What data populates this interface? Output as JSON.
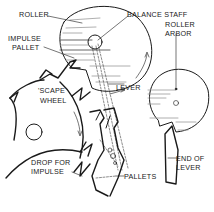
{
  "diagram": {
    "labels": {
      "roller": "ROLLER",
      "impulse_pallet_1": "IMPULSE",
      "impulse_pallet_2": "PALLET",
      "balance_staff": "BALANCE STAFF",
      "roller_arbor_1": "ROLLER",
      "roller_arbor_2": "ARBOR",
      "lever": "LEVER",
      "scape_wheel_1": "'SCAPE",
      "scape_wheel_2": "WHEEL",
      "drop_for_impulse_1": "DROP FOR",
      "drop_for_impulse_2": "IMPULSE",
      "pallets": "PALLETS",
      "end_of_lever_1": "END OF",
      "end_of_lever_2": "LEVER"
    },
    "components": [
      "roller",
      "impulse-pallet",
      "balance-staff",
      "roller-arbor",
      "lever",
      "scape-wheel",
      "pallets",
      "end-of-lever"
    ],
    "colors": {
      "ink": "#1a1a1a",
      "background": "#ffffff",
      "shading": "#9a9a9a"
    }
  }
}
